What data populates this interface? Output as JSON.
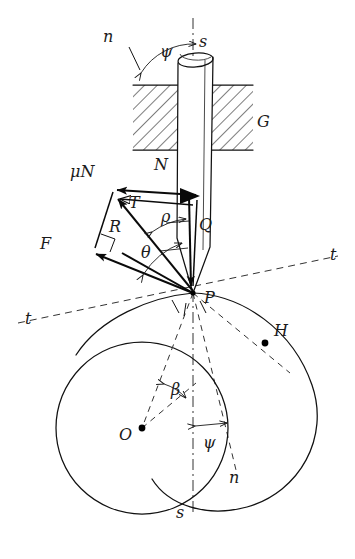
{
  "figure": {
    "type": "mechanics-free-body-diagram",
    "background_color": "#ffffff",
    "ink_color": "#111111"
  },
  "labels": {
    "n_top": "n",
    "s_top": "s",
    "psi_top": "ψ",
    "block_G": "G",
    "force_muN": "μN",
    "force_N": "N",
    "force_T": "T",
    "force_R": "R",
    "force_F": "F",
    "force_Q": "Q",
    "angle_rho": "ρ",
    "angle_theta": "θ",
    "point_P": "P",
    "point_H": "H",
    "point_O": "O",
    "angle_beta": "β",
    "angle_psi_bottom": "ψ",
    "n_bottom": "n",
    "s_bottom": "s",
    "t_left": "t",
    "t_right": "t"
  },
  "geometry": {
    "contact_point_P": [
      193,
      293
    ],
    "circle_center_O": [
      142,
      428
    ],
    "circle_radius": 86,
    "point_H": [
      265,
      343
    ],
    "rod_axis": "vertical dash-dot through x=193",
    "block_rect": [
      133,
      85,
      120,
      65
    ],
    "tangent_line_t": "dashed line through P sloping up to the right",
    "normal_line_n": "dashed line through P sloping down to the right"
  },
  "vectors": [
    {
      "name": "N",
      "label": "N",
      "from": [
        193,
        205
      ],
      "to": [
        108,
        196
      ],
      "style": "solid-open-head"
    },
    {
      "name": "muN",
      "label": "μN",
      "from": [
        193,
        196
      ],
      "to": [
        108,
        188
      ],
      "style": "solid-filled-head"
    },
    {
      "name": "T",
      "label": "T",
      "from": [
        193,
        293
      ],
      "to": [
        110,
        198
      ],
      "style": "solid-filled-head"
    },
    {
      "name": "R",
      "label": "R",
      "from": [
        193,
        293
      ],
      "to": [
        83,
        248
      ],
      "style": "solid-filled-head"
    },
    {
      "name": "F",
      "label": "F",
      "from": [
        193,
        293
      ],
      "to": [
        83,
        248
      ],
      "style": "solid-filled-head"
    },
    {
      "name": "Q",
      "label": "Q",
      "from": [
        193,
        196
      ],
      "to": [
        193,
        293
      ],
      "style": "solid-filled-head"
    }
  ],
  "angles": [
    {
      "name": "psi_top",
      "label": "ψ",
      "at": [
        193,
        58
      ],
      "between": "rod axis s and normal n"
    },
    {
      "name": "rho",
      "label": "ρ",
      "at": [
        193,
        293
      ],
      "between": "Q and R"
    },
    {
      "name": "theta",
      "label": "θ",
      "at": [
        193,
        293
      ],
      "between": "Q and F"
    },
    {
      "name": "beta",
      "label": "β",
      "at": [
        142,
        428
      ],
      "between": "OP and O-vertical"
    },
    {
      "name": "psi_bottom",
      "label": "ψ",
      "at": [
        193,
        293
      ],
      "between": "s-axis and n-axis"
    }
  ]
}
